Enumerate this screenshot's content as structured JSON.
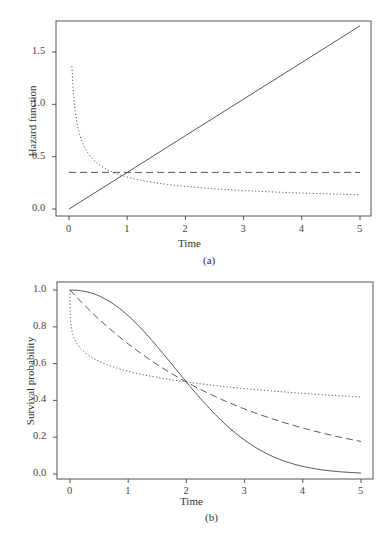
{
  "chart_data": [
    {
      "type": "line",
      "panel_label": "(a)",
      "title": "",
      "xlabel": "Time",
      "ylabel": "Hazard function",
      "xlim": [
        0,
        5
      ],
      "ylim": [
        0,
        1.75
      ],
      "xticks": [
        "0",
        "1",
        "2",
        "3",
        "4",
        "5"
      ],
      "yticks": [
        "0.0",
        "0.5",
        "1.0",
        "1.5"
      ],
      "grid": false,
      "legend": null,
      "series": [
        {
          "name": "solid (increasing hazard)",
          "style": "solid",
          "x": [
            0,
            1,
            2,
            3,
            4,
            5
          ],
          "values": [
            0.0,
            0.35,
            0.7,
            1.05,
            1.4,
            1.75
          ]
        },
        {
          "name": "dashed (constant hazard)",
          "style": "dashed",
          "x": [
            0,
            1,
            2,
            3,
            4,
            5
          ],
          "values": [
            0.35,
            0.35,
            0.35,
            0.35,
            0.35,
            0.35
          ]
        },
        {
          "name": "dotted (decreasing hazard)",
          "style": "dotted",
          "x": [
            0.05,
            0.1,
            0.2,
            0.3,
            0.5,
            1,
            2,
            3,
            4,
            5
          ],
          "values": [
            1.36,
            0.96,
            0.68,
            0.56,
            0.43,
            0.3,
            0.21,
            0.17,
            0.15,
            0.14
          ]
        }
      ]
    },
    {
      "type": "line",
      "panel_label": "(b)",
      "title": "",
      "xlabel": "Time",
      "ylabel": "Survival probability",
      "xlim": [
        0,
        5
      ],
      "ylim": [
        0,
        1.0
      ],
      "xticks": [
        "0",
        "1",
        "2",
        "3",
        "4",
        "5"
      ],
      "yticks": [
        "0.0",
        "0.2",
        "0.4",
        "0.6",
        "0.8",
        "1.0"
      ],
      "grid": false,
      "legend": null,
      "series": [
        {
          "name": "solid",
          "style": "solid",
          "x": [
            0,
            0.5,
            1,
            1.5,
            2,
            2.5,
            3,
            3.5,
            4,
            4.5,
            5
          ],
          "values": [
            1.0,
            0.96,
            0.84,
            0.68,
            0.5,
            0.34,
            0.21,
            0.12,
            0.06,
            0.03,
            0.02
          ]
        },
        {
          "name": "dashed",
          "style": "dashed",
          "x": [
            0,
            1,
            2,
            3,
            4,
            5
          ],
          "values": [
            1.0,
            0.71,
            0.5,
            0.35,
            0.25,
            0.18
          ]
        },
        {
          "name": "dotted",
          "style": "dotted",
          "x": [
            0,
            0.05,
            0.2,
            0.5,
            1,
            2,
            3,
            4,
            5
          ],
          "values": [
            1.0,
            0.8,
            0.7,
            0.62,
            0.57,
            0.5,
            0.46,
            0.43,
            0.4
          ]
        }
      ]
    }
  ]
}
